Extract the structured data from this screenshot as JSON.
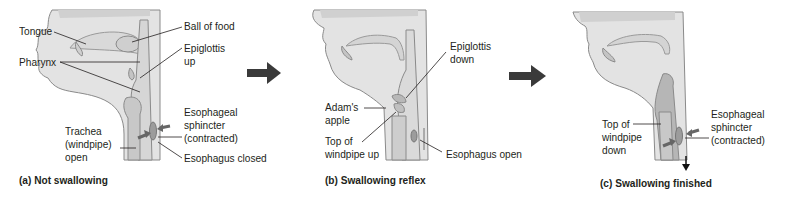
{
  "diagram": {
    "colors": {
      "tissue": "#e3e3e3",
      "outline": "#8a8a8a",
      "dark_tissue": "#b4b4b4",
      "arrow": "#4a4a4a",
      "text": "#231f20"
    },
    "panels": [
      {
        "caption": "(a) Not swallowing",
        "labels": {
          "tongue": "Tongue",
          "pharynx": "Pharynx",
          "ball_of_food": "Ball of food",
          "epiglottis": "Epiglottis\nup",
          "sphincter": "Esophageal\nsphincter\n(contracted)",
          "trachea": "Trachea\n(windpipe)\nopen",
          "esophagus": "Esophagus closed"
        }
      },
      {
        "caption": "(b) Swallowing reflex",
        "labels": {
          "epiglottis": "Epiglottis\ndown",
          "adams_apple": "Adam's\napple",
          "windpipe": "Top of\nwindpipe up",
          "esophagus": "Esophagus open"
        }
      },
      {
        "caption": "(c) Swallowing finished",
        "labels": {
          "windpipe": "Top of\nwindpipe\ndown",
          "sphincter": "Esophageal\nsphincter\n(contracted)"
        }
      }
    ],
    "transition_arrows": [
      "right-arrow",
      "right-arrow"
    ]
  }
}
